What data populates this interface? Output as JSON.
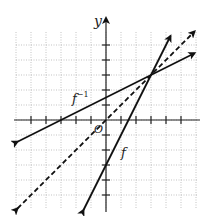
{
  "chart_data": {
    "type": "line",
    "title": "",
    "xlabel": "",
    "ylabel": "y",
    "origin_label": "O",
    "xlim": [
      -6,
      6
    ],
    "ylim": [
      -6,
      6
    ],
    "grid": true,
    "tick_step": 1,
    "series": [
      {
        "name": "f",
        "label": "f",
        "equation": "y = 2x - 3",
        "style": "solid",
        "points": [
          [
            -1.5,
            -6
          ],
          [
            0,
            -3
          ],
          [
            3,
            3
          ],
          [
            4.3,
            5.6
          ]
        ]
      },
      {
        "name": "f_inverse",
        "label": "f⁻¹",
        "equation": "y = (x + 3) / 2",
        "style": "solid",
        "points": [
          [
            -5.9,
            -1.45
          ],
          [
            -3,
            0
          ],
          [
            0,
            1.5
          ],
          [
            3,
            3
          ],
          [
            5.9,
            4.45
          ]
        ]
      },
      {
        "name": "identity",
        "label": "y = x",
        "equation": "y = x",
        "style": "dashed",
        "points": [
          [
            -5.9,
            -5.9
          ],
          [
            0,
            0
          ],
          [
            3,
            3
          ],
          [
            5.9,
            5.9
          ]
        ]
      }
    ],
    "annotations": [
      {
        "text": "f",
        "near": [
          3.4,
          -3.8
        ]
      },
      {
        "text": "f⁻¹",
        "near": [
          -2.2,
          2.2
        ]
      },
      {
        "text": "intersection",
        "point": [
          3,
          3
        ]
      }
    ]
  },
  "labels": {
    "y_axis": "y",
    "origin": "O",
    "f": "f",
    "f_inv_base": "f",
    "f_inv_sup": "−1"
  },
  "colors": {
    "line": "#111111",
    "grid": "#9a9a9a",
    "axis": "#222222"
  }
}
